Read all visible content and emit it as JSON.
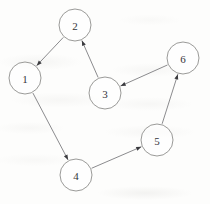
{
  "diagram": {
    "type": "directed-graph",
    "canvas": {
      "width": 210,
      "height": 204
    },
    "style": {
      "background_color": "#fdfdfc",
      "node_stroke_color": "#8e8e8c",
      "node_fill_color": "#ffffff",
      "label_color": "#35353a",
      "edge_color": "#76767a",
      "arrowhead_color": "#3a3a3e",
      "node_radius": 16
    },
    "nodes": [
      {
        "id": "1",
        "label": "1",
        "cx": 25,
        "cy": 78,
        "r": 16
      },
      {
        "id": "2",
        "label": "2",
        "cx": 75,
        "cy": 25,
        "r": 16
      },
      {
        "id": "3",
        "label": "3",
        "cx": 105,
        "cy": 93,
        "r": 16
      },
      {
        "id": "4",
        "label": "4",
        "cx": 76,
        "cy": 175,
        "r": 16
      },
      {
        "id": "5",
        "label": "5",
        "cx": 157,
        "cy": 140,
        "r": 16
      },
      {
        "id": "6",
        "label": "6",
        "cx": 183,
        "cy": 58,
        "r": 16
      }
    ],
    "edges": [
      {
        "id": "e-2-1",
        "from": "2",
        "to": "1",
        "label": ""
      },
      {
        "id": "e-1-4",
        "from": "1",
        "to": "4",
        "label": ""
      },
      {
        "id": "e-4-5",
        "from": "4",
        "to": "5",
        "label": ""
      },
      {
        "id": "e-5-6",
        "from": "5",
        "to": "6",
        "label": ""
      },
      {
        "id": "e-6-3",
        "from": "6",
        "to": "3",
        "label": ""
      },
      {
        "id": "e-3-2",
        "from": "3",
        "to": "2",
        "label": ""
      }
    ]
  }
}
